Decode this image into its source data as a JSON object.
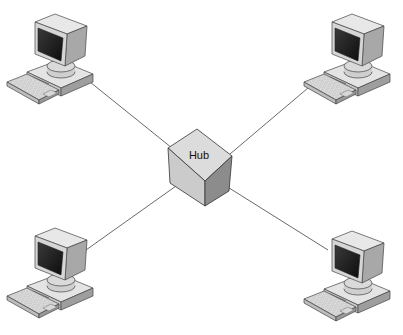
{
  "diagram": {
    "type": "star-network-topology",
    "hub": {
      "label": "Hub"
    },
    "nodes": [
      {
        "id": "computer-top-left",
        "kind": "computer"
      },
      {
        "id": "computer-top-right",
        "kind": "computer"
      },
      {
        "id": "computer-bottom-left",
        "kind": "computer"
      },
      {
        "id": "computer-bottom-right",
        "kind": "computer"
      }
    ],
    "edges": [
      {
        "from": "computer-top-left",
        "to": "hub"
      },
      {
        "from": "computer-top-right",
        "to": "hub"
      },
      {
        "from": "computer-bottom-left",
        "to": "hub"
      },
      {
        "from": "computer-bottom-right",
        "to": "hub"
      }
    ],
    "colors": {
      "line": "#555555",
      "hub_top": "#d9d9d9",
      "hub_left": "#c4c4c4",
      "hub_right": "#8a8a8a",
      "screen": "#1a1a1a",
      "casing": "#dcdcdc"
    }
  }
}
